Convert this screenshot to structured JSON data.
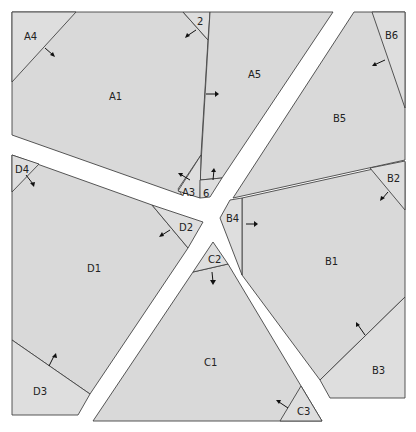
{
  "diagram": {
    "type": "paper-piecing pattern",
    "colors": {
      "fill_main": "#d9d9d9",
      "fill_light": "#e0e0e0",
      "stroke": "#444444",
      "background": "#ffffff"
    },
    "sections": [
      {
        "name": "A",
        "pieces": [
          {
            "id": "A1",
            "label": "A1",
            "x": 115,
            "y": 97
          },
          {
            "id": "A2",
            "label": "2",
            "x": 200,
            "y": 22
          },
          {
            "id": "A3",
            "label": "A3",
            "x": 189,
            "y": 192
          },
          {
            "id": "A4",
            "label": "A4",
            "x": 30,
            "y": 38
          },
          {
            "id": "A5",
            "label": "A5",
            "x": 255,
            "y": 76
          },
          {
            "id": "A6",
            "label": "6",
            "x": 206,
            "y": 193
          }
        ]
      },
      {
        "name": "B",
        "pieces": [
          {
            "id": "B1",
            "label": "B1",
            "x": 331,
            "y": 262
          },
          {
            "id": "B2",
            "label": "B2",
            "x": 394,
            "y": 178
          },
          {
            "id": "B3",
            "label": "B3",
            "x": 378,
            "y": 371
          },
          {
            "id": "B4",
            "label": "B4",
            "x": 233,
            "y": 220
          },
          {
            "id": "B5",
            "label": "B5",
            "x": 339,
            "y": 119
          },
          {
            "id": "B6",
            "label": "B6",
            "x": 386,
            "y": 36
          }
        ]
      },
      {
        "name": "C",
        "pieces": [
          {
            "id": "C1",
            "label": "C1",
            "x": 211,
            "y": 363
          },
          {
            "id": "C2",
            "label": "C2",
            "x": 215,
            "y": 261
          },
          {
            "id": "C3",
            "label": "C3",
            "x": 303,
            "y": 412
          }
        ]
      },
      {
        "name": "D",
        "pieces": [
          {
            "id": "D1",
            "label": "D1",
            "x": 93,
            "y": 269
          },
          {
            "id": "D2",
            "label": "D2",
            "x": 185,
            "y": 228
          },
          {
            "id": "D3",
            "label": "D3",
            "x": 39,
            "y": 392
          },
          {
            "id": "D4",
            "label": "D4",
            "x": 22,
            "y": 170
          }
        ]
      }
    ],
    "caption": "(partially visible, cut off)"
  }
}
